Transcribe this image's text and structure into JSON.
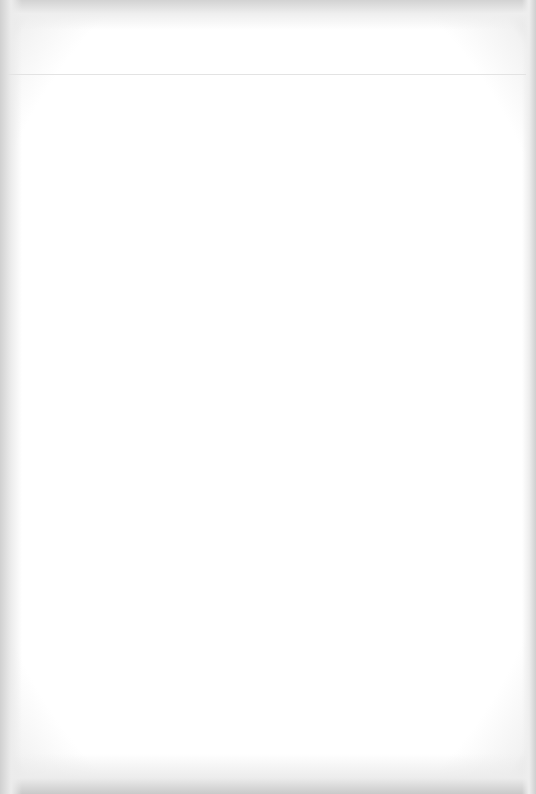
{
  "page": {
    "background_color": "#ffffff",
    "edge_color": "#d0d0d0",
    "header_rule": {
      "visible": true,
      "y": 74,
      "color": "#e3e3e3"
    },
    "content": []
  }
}
